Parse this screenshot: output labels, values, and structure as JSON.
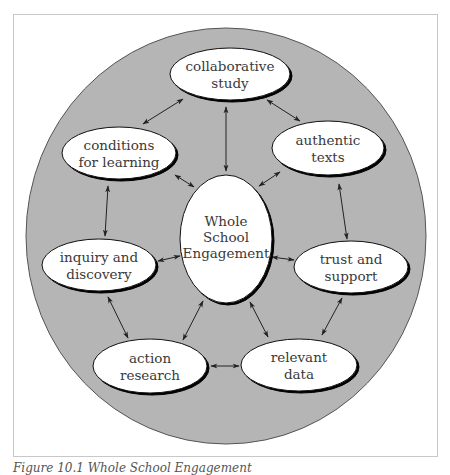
{
  "figure": {
    "caption": "Figure 10.1 Whole School Engagement",
    "colors": {
      "ring_fill": "#b5b5b5",
      "ring_stroke": "#555555",
      "node_fill": "#ffffff",
      "node_stroke": "#111111",
      "text": "#3a3a3a",
      "arrow": "#222222"
    }
  },
  "nodes": {
    "center": {
      "lines": [
        "Whole",
        "School",
        "Engagement"
      ]
    },
    "collaborative": {
      "lines": [
        "collaborative",
        "study"
      ]
    },
    "conditions": {
      "lines": [
        "conditions",
        "for learning"
      ]
    },
    "authentic": {
      "lines": [
        "authentic",
        "texts"
      ]
    },
    "inquiry": {
      "lines": [
        "inquiry and",
        "discovery"
      ]
    },
    "trust": {
      "lines": [
        "trust and",
        "support"
      ]
    },
    "action": {
      "lines": [
        "action",
        "research"
      ]
    },
    "relevant": {
      "lines": [
        "relevant",
        "data"
      ]
    }
  },
  "edges": [
    {
      "from": "collaborative",
      "to": "conditions"
    },
    {
      "from": "collaborative",
      "to": "authentic"
    },
    {
      "from": "collaborative",
      "to": "center"
    },
    {
      "from": "conditions",
      "to": "center"
    },
    {
      "from": "authentic",
      "to": "center"
    },
    {
      "from": "conditions",
      "to": "inquiry"
    },
    {
      "from": "authentic",
      "to": "trust"
    },
    {
      "from": "inquiry",
      "to": "center"
    },
    {
      "from": "trust",
      "to": "center"
    },
    {
      "from": "inquiry",
      "to": "action"
    },
    {
      "from": "trust",
      "to": "relevant"
    },
    {
      "from": "action",
      "to": "center"
    },
    {
      "from": "relevant",
      "to": "center"
    },
    {
      "from": "action",
      "to": "relevant"
    }
  ]
}
